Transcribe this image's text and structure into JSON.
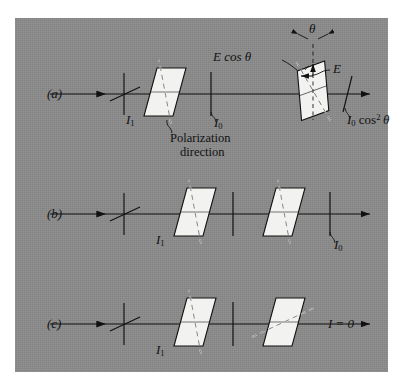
{
  "figure": {
    "type": "optics-polarization-diagram",
    "background_color": "#8b8b8b",
    "page_color": "#ffffff",
    "plate_fill": "#f2f2f0",
    "line_color": "#111111",
    "panel": {
      "x": 15,
      "y": 18,
      "width": 373,
      "height": 354
    }
  },
  "rows": [
    {
      "id": "a",
      "label": "(a)",
      "axis_y": 94,
      "incident_intensity": "I1",
      "labels": {
        "i1": "I",
        "i1_sub": "1",
        "i0": "I",
        "i0_sub": "0",
        "e_cos_theta": "E cos θ",
        "e_field": "E",
        "theta": "θ",
        "output": "I",
        "output_sub": "0",
        "output_rest": "cos",
        "output_sup": "2",
        "output_theta": "θ"
      },
      "polarization_note_line1": "Polarization",
      "polarization_note_line2": "direction",
      "analyzer_angle_deg": 20
    },
    {
      "id": "b",
      "label": "(b)",
      "axis_y": 214,
      "labels": {
        "i1": "I",
        "i1_sub": "1",
        "i0": "I",
        "i0_sub": "0"
      },
      "analyzer_angle_deg": 0
    },
    {
      "id": "c",
      "label": "(c)",
      "axis_y": 324,
      "labels": {
        "i1": "I",
        "i1_sub": "1",
        "result": "I = 0"
      },
      "analyzer_angle_deg": 90
    }
  ],
  "glyphs": {
    "theta": "θ",
    "arrow": "→"
  }
}
